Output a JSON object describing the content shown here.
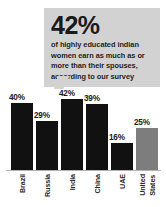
{
  "callout": {
    "stat": "42%",
    "body": "of highly educated indian women earn as much as or more than their spouses, according to our survey",
    "background_color": "#d2d2d2"
  },
  "chart_data": {
    "type": "bar",
    "title": "",
    "subtitle": "",
    "xlabel": "",
    "ylabel": "",
    "ylim": [
      0,
      50
    ],
    "grid": false,
    "legend": false,
    "categories": [
      "Brazil",
      "Russia",
      "India",
      "China",
      "UAE",
      "United States"
    ],
    "values": [
      40,
      29,
      42,
      39,
      16,
      25
    ],
    "value_labels": [
      "40%",
      "29%",
      "42%",
      "39%",
      "16%",
      "25%"
    ],
    "bar_colors": [
      "#111111",
      "#111111",
      "#111111",
      "#111111",
      "#111111",
      "#7d7d7d"
    ],
    "highlight_category": "United States",
    "bars": [
      {
        "category": "Brazil",
        "category_lines": [
          "Brazil"
        ],
        "value": 40,
        "label": "40%",
        "color": "#111111"
      },
      {
        "category": "Russia",
        "category_lines": [
          "Russia"
        ],
        "value": 29,
        "label": "29%",
        "color": "#111111"
      },
      {
        "category": "India",
        "category_lines": [
          "India"
        ],
        "value": 42,
        "label": "42%",
        "color": "#111111"
      },
      {
        "category": "China",
        "category_lines": [
          "China"
        ],
        "value": 39,
        "label": "39%",
        "color": "#111111"
      },
      {
        "category": "UAE",
        "category_lines": [
          "UAE"
        ],
        "value": 16,
        "label": "16%",
        "color": "#111111"
      },
      {
        "category": "United States",
        "category_lines": [
          "United",
          "States"
        ],
        "value": 25,
        "label": "25%",
        "color": "#7d7d7d"
      }
    ]
  },
  "colors": {
    "background": "#ffffff",
    "bar_default": "#111111",
    "bar_highlight": "#7d7d7d",
    "callout": "#d2d2d2",
    "baseline": "#b4b4b4",
    "text": "#1a1a1a"
  }
}
